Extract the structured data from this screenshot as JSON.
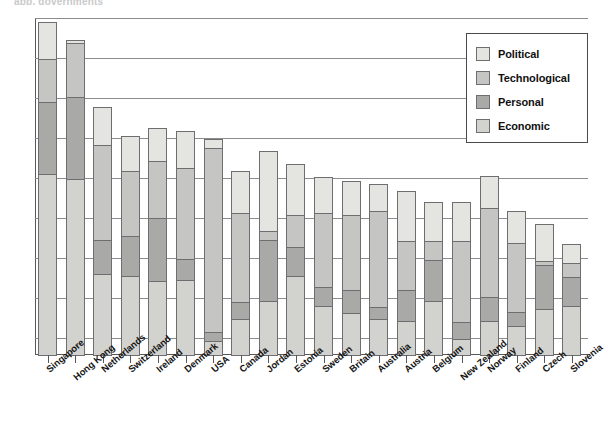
{
  "cut_title": "app, governments",
  "legend": {
    "position": "top-right",
    "entries": [
      {
        "label": "Political",
        "color": "#e4e4e1",
        "swatch_name": "legend-swatch-political"
      },
      {
        "label": "Technological",
        "color": "#c5c5c3",
        "swatch_name": "legend-swatch-technological"
      },
      {
        "label": "Personal",
        "color": "#a9a9a7",
        "swatch_name": "legend-swatch-personal"
      },
      {
        "label": "Economic",
        "color": "#d2d2cf",
        "swatch_name": "legend-swatch-economic"
      }
    ]
  },
  "axis": {
    "gridlines_y_px": [
      0,
      40,
      80,
      120,
      160,
      200,
      240,
      280,
      320
    ],
    "baseline_label": "",
    "ylabel": "",
    "xlabel": ""
  },
  "chart_data": {
    "type": "bar",
    "subtype": "stacked-vertical",
    "title": "",
    "xlabel": "",
    "ylabel": "",
    "ylim": [
      0,
      100
    ],
    "grid": true,
    "legend_position": "top-right",
    "stack_order_bottom_to_top": [
      "Economic",
      "Personal",
      "Technological",
      "Political"
    ],
    "categories": [
      "Singapore",
      "Hong Kong",
      "Netherlands",
      "Switzerland",
      "Ireland",
      "Denmark",
      "USA",
      "Canada",
      "Jordan",
      "Estonia",
      "Sweden",
      "Britain",
      "Australia",
      "Austria",
      "Belgium",
      "New Zealand",
      "Norway",
      "Finland",
      "Czech",
      "Slovenia"
    ],
    "series": [
      {
        "name": "Political",
        "color": "#e4e4e1",
        "values": [
          11.3,
          1.2,
          11.6,
          10.7,
          10.1,
          11.3,
          3.0,
          12.8,
          24.0,
          15.4,
          11.0,
          10.4,
          8.3,
          15.1,
          11.9,
          11.9,
          9.8,
          9.8,
          11.3,
          5.9
        ]
      },
      {
        "name": "Technological",
        "color": "#c5c5c3",
        "values": [
          13.1,
          16.3,
          28.5,
          19.6,
          17.2,
          27.2,
          54.9,
          26.7,
          3.0,
          9.8,
          22.3,
          22.6,
          28.8,
          14.8,
          5.9,
          24.3,
          26.7,
          20.8,
          1.5,
          4.5
        ]
      },
      {
        "name": "Personal",
        "color": "#a9a9a7",
        "values": [
          21.7,
          24.6,
          10.4,
          12.2,
          19.0,
          6.5,
          3.0,
          5.3,
          18.4,
          8.9,
          5.9,
          7.1,
          3.9,
          9.5,
          12.5,
          5.3,
          7.4,
          4.5,
          13.4,
          8.9
        ]
      },
      {
        "name": "Economic",
        "color": "#d2d2cf",
        "values": [
          54.0,
          52.5,
          24.3,
          23.7,
          22.3,
          22.6,
          4.5,
          11.0,
          16.3,
          23.7,
          14.8,
          12.8,
          11.0,
          10.4,
          16.3,
          5.0,
          10.4,
          8.9,
          14.0,
          14.8
        ]
      }
    ],
    "totals": [
      100.0,
      94.7,
      74.8,
      66.2,
      68.5,
      67.7,
      65.3,
      55.8,
      61.7,
      57.9,
      54.0,
      52.8,
      52.0,
      49.9,
      46.6,
      46.6,
      54.3,
      44.0,
      40.2,
      34.1
    ]
  }
}
